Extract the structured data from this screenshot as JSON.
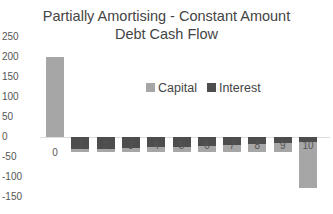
{
  "chart_data": {
    "type": "bar",
    "stacked": true,
    "title": "Partially Amortising - Constant Amount Debt Cash Flow",
    "title_lines": [
      "Partially Amortising - Constant Amount",
      "Debt Cash Flow"
    ],
    "categories": [
      "0",
      "1",
      "2",
      "3",
      "4",
      "5",
      "6",
      "7",
      "8",
      "9",
      "10"
    ],
    "series": [
      {
        "name": "Capital",
        "color": "#a6a6a6",
        "values": [
          200,
          -8,
          -9,
          -10,
          -12,
          -13,
          -15,
          -17,
          -20,
          -23,
          -115
        ]
      },
      {
        "name": "Interest",
        "color": "#4d4d4d",
        "values": [
          0,
          -30,
          -29,
          -28,
          -26,
          -25,
          -23,
          -21,
          -18,
          -15,
          -12
        ]
      }
    ],
    "yticks": [
      250,
      200,
      150,
      100,
      50,
      0,
      -50,
      -100,
      -150
    ],
    "ylim": [
      -150,
      250
    ],
    "xlabel": "",
    "ylabel": "",
    "grid": false,
    "legend_position": "inside-top-center"
  }
}
